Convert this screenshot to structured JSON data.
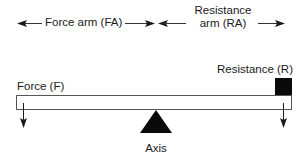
{
  "diagram": {
    "type": "first-class lever",
    "labels": {
      "force_arm": "Force arm (FA)",
      "resistance_arm_line1": "Resistance",
      "resistance_arm_line2": "arm (RA)",
      "force": "Force (F)",
      "resistance": "Resistance (R)",
      "axis": "Axis"
    },
    "colors": {
      "ink": "#1a1a1a",
      "beam_stroke": "#555555",
      "beam_fill": "#ffffff"
    },
    "elements": [
      {
        "id": "force-arm-span",
        "kind": "dimension-arrow",
        "from": "left end",
        "to": "axis"
      },
      {
        "id": "resistance-arm-span",
        "kind": "dimension-arrow",
        "from": "axis",
        "to": "right end"
      },
      {
        "id": "beam",
        "kind": "lever-bar"
      },
      {
        "id": "fulcrum",
        "kind": "triangle",
        "label": "Axis"
      },
      {
        "id": "resistance-weight",
        "kind": "square",
        "position": "right end"
      },
      {
        "id": "force-vector",
        "kind": "down-arrow",
        "position": "left end"
      },
      {
        "id": "resistance-vector",
        "kind": "down-arrow",
        "position": "right end"
      }
    ]
  }
}
